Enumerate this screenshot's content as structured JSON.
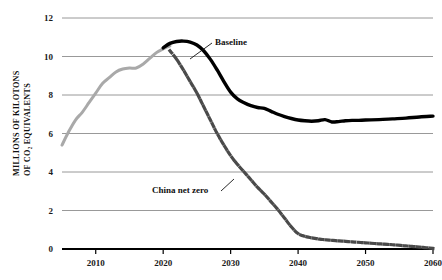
{
  "chart_data": {
    "type": "line",
    "title": "",
    "xlabel": "",
    "ylabel": "MILLIONS OF KILOTONS OF CO2 EQUIVALENTS",
    "ylabel_line1": "MILLIONS OF KILOTONS",
    "ylabel_line2": "OF CO₂ EQUIVALENTS",
    "xlim": [
      2005,
      2060
    ],
    "ylim": [
      0,
      12
    ],
    "grid": true,
    "grid_axis": "y",
    "legend_position": "inline-annotations",
    "yticks": [
      0,
      2,
      4,
      6,
      8,
      10,
      12
    ],
    "ytick_labels": [
      "0",
      "2",
      "4",
      "6",
      "8",
      "10",
      "12"
    ],
    "xticks": [
      2010,
      2020,
      2030,
      2040,
      2050,
      2060
    ],
    "xtick_labels": [
      "2010",
      "2020",
      "2030",
      "2040",
      "2050",
      "2060"
    ],
    "series": [
      {
        "name": "Historical",
        "style": "solid",
        "color": "#a9a9a9",
        "width": 3.0,
        "label_shown": false,
        "x": [
          2005,
          2006,
          2007,
          2008,
          2009,
          2010,
          2011,
          2012,
          2013,
          2014,
          2015,
          2016,
          2017,
          2018,
          2019,
          2020,
          2021
        ],
        "values": [
          5.4,
          6.1,
          6.7,
          7.1,
          7.6,
          8.1,
          8.6,
          8.9,
          9.2,
          9.35,
          9.4,
          9.4,
          9.6,
          9.9,
          10.2,
          10.4,
          10.55
        ]
      },
      {
        "name": "Baseline",
        "style": "solid",
        "color": "#000000",
        "width": 3.4,
        "label_shown": true,
        "label": "Baseline",
        "x": [
          2020,
          2021,
          2022,
          2023,
          2024,
          2025,
          2026,
          2027,
          2028,
          2029,
          2030,
          2031,
          2032,
          2033,
          2034,
          2035,
          2036,
          2037,
          2038,
          2039,
          2040,
          2041,
          2042,
          2043,
          2044,
          2045,
          2046,
          2047,
          2048,
          2049,
          2050,
          2052,
          2054,
          2056,
          2058,
          2060
        ],
        "values": [
          10.45,
          10.68,
          10.78,
          10.8,
          10.75,
          10.6,
          10.3,
          9.85,
          9.3,
          8.7,
          8.15,
          7.8,
          7.6,
          7.45,
          7.35,
          7.3,
          7.15,
          7.0,
          6.88,
          6.78,
          6.7,
          6.66,
          6.64,
          6.66,
          6.72,
          6.6,
          6.62,
          6.66,
          6.68,
          6.68,
          6.7,
          6.72,
          6.76,
          6.8,
          6.86,
          6.9
        ]
      },
      {
        "name": "China net zero",
        "style": "dashed",
        "color": "#4a4a4a",
        "width": 3.2,
        "label_shown": true,
        "label": "China net zero",
        "x": [
          2021,
          2022,
          2023,
          2024,
          2025,
          2026,
          2027,
          2028,
          2029,
          2030,
          2031,
          2032,
          2033,
          2034,
          2035,
          2036,
          2037,
          2038,
          2039,
          2040,
          2041,
          2042,
          2043,
          2044,
          2045,
          2046,
          2047,
          2048,
          2050,
          2052,
          2054,
          2056,
          2058,
          2060
        ],
        "values": [
          10.3,
          9.85,
          9.3,
          8.7,
          8.1,
          7.4,
          6.7,
          6.0,
          5.4,
          4.85,
          4.4,
          4.0,
          3.6,
          3.2,
          2.85,
          2.45,
          2.05,
          1.6,
          1.15,
          0.8,
          0.66,
          0.58,
          0.52,
          0.48,
          0.45,
          0.42,
          0.4,
          0.37,
          0.32,
          0.27,
          0.22,
          0.16,
          0.1,
          0.03
        ]
      }
    ],
    "annotations": [
      {
        "text": "Baseline",
        "x_px": 215,
        "y_px": 45,
        "leader_to_x": 190,
        "leader_to_y": 58
      },
      {
        "text": "China net zero",
        "x_px": 152,
        "y_px": 193,
        "leader_to_x": 228,
        "leader_to_y": 178
      }
    ]
  }
}
